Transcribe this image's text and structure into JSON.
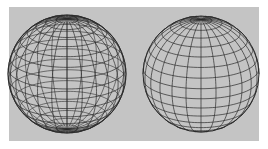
{
  "figure": {
    "background_color": "#c4c4c4",
    "line_color": "#2a2a2a",
    "panel": {
      "x": 9,
      "y": 7,
      "w": 250,
      "h": 134
    }
  },
  "spheres": [
    {
      "name": "wireframe-sphere-see-through",
      "cx": 67,
      "cy": 74,
      "r": 59,
      "tilt_deg": 20,
      "meridians": 24,
      "parallels": 17,
      "hidden_lines": true
    },
    {
      "name": "wireframe-sphere-hidden-line-removed",
      "cx": 201,
      "cy": 74,
      "r": 58,
      "tilt_deg": 20,
      "meridians": 24,
      "parallels": 17,
      "hidden_lines": false
    }
  ]
}
